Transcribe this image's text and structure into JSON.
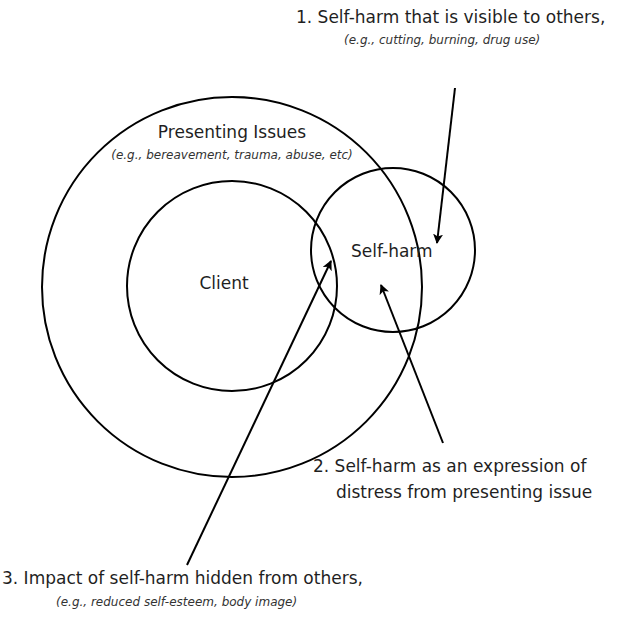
{
  "diagram": {
    "circles": [
      {
        "id": "presenting-issues",
        "cx": 232,
        "cy": 287,
        "r": 190
      },
      {
        "id": "client",
        "cx": 232,
        "cy": 286,
        "r": 105
      },
      {
        "id": "self-harm",
        "cx": 393,
        "cy": 250,
        "r": 82
      }
    ],
    "stroke_color": "#000000",
    "outer_circle": {
      "title": "Presenting Issues",
      "subtitle": "(e.g., bereavement, trauma, abuse, etc)"
    },
    "inner_circle": {
      "title": "Client"
    },
    "self_harm_circle": {
      "title": "Self-harm"
    },
    "annotations": [
      {
        "number": "1.",
        "line1": "1. Self-harm that is visible to others,",
        "line2": "(e.g., cutting, burning, drug use)"
      },
      {
        "number": "2.",
        "line1": "2. Self-harm as an expression of",
        "line2": "distress from presenting issue"
      },
      {
        "number": "3.",
        "line1": "3. Impact of self-harm hidden from others,",
        "line2": "(e.g., reduced self-esteem, body image)"
      }
    ]
  }
}
